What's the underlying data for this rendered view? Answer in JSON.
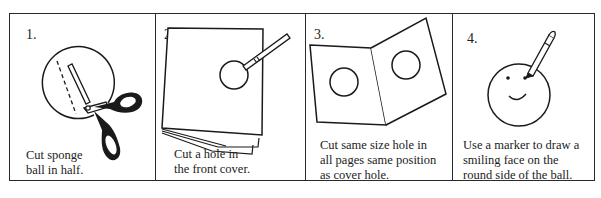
{
  "steps": [
    {
      "number": "1.",
      "illustration": "scissors-cutting-ball",
      "caption_lines": [
        "Cut sponge",
        "ball in half."
      ]
    },
    {
      "number": "2.",
      "illustration": "booklet-with-hole-and-pen",
      "caption_lines": [
        "Cut a hole in",
        "the front cover."
      ]
    },
    {
      "number": "3.",
      "illustration": "open-pages-with-holes",
      "caption_lines": [
        "Cut same size hole in",
        "all pages same position",
        "as cover hole."
      ]
    },
    {
      "number": "4.",
      "illustration": "smiley-ball-with-marker",
      "caption_lines": [
        "Use a marker to draw a",
        "smiling face on the",
        "round side of the ball."
      ]
    }
  ],
  "colors": {
    "ink": "#1a1a1a",
    "background": "#ffffff"
  }
}
